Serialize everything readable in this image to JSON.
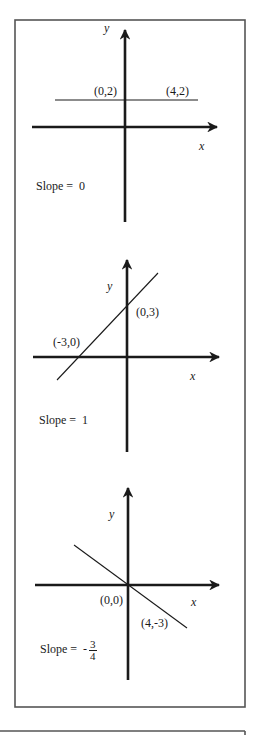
{
  "colors": {
    "ink": "#1a1a1a",
    "frame": "#555555",
    "background": "#ffffff"
  },
  "frame": {
    "x": 15,
    "y": 20,
    "w": 230,
    "h": 687
  },
  "next_frame": {
    "x": 0,
    "y": 731,
    "w": 245
  },
  "panels": [
    {
      "id": "zero-slope",
      "y_axis": {
        "x": 125,
        "top": 30,
        "bottom": 222
      },
      "x_axis": {
        "y": 127,
        "left": 32,
        "right": 217
      },
      "line": {
        "x1": 55,
        "y1": 100,
        "x2": 198,
        "y2": 100
      },
      "labels": [
        {
          "name": "y-axis-label",
          "text": "y",
          "x": 104,
          "y": 22,
          "axis": true
        },
        {
          "name": "point-label-0-2",
          "text": "(0,2)",
          "x": 94,
          "y": 85
        },
        {
          "name": "point-label-4-2",
          "text": "(4,2)",
          "x": 166,
          "y": 85
        },
        {
          "name": "x-axis-label",
          "text": "x",
          "x": 199,
          "y": 140,
          "axis": true
        }
      ],
      "slope": {
        "prefix": "Slope =  ",
        "value": "0",
        "x": 36,
        "y": 180
      }
    },
    {
      "id": "positive-slope",
      "y_axis": {
        "x": 127,
        "top": 260,
        "bottom": 452
      },
      "x_axis": {
        "y": 357,
        "left": 33,
        "right": 219
      },
      "line": {
        "x1": 57,
        "y1": 380,
        "x2": 158,
        "y2": 273
      },
      "labels": [
        {
          "name": "y-axis-label",
          "text": "y",
          "x": 107,
          "y": 280,
          "axis": true
        },
        {
          "name": "point-label-0-3",
          "text": "(0,3)",
          "x": 136,
          "y": 306
        },
        {
          "name": "point-label-neg3-0",
          "text": "(-3,0)",
          "x": 53,
          "y": 336
        },
        {
          "name": "x-axis-label",
          "text": "x",
          "x": 190,
          "y": 370,
          "axis": true
        }
      ],
      "slope": {
        "prefix": "Slope =  ",
        "value": "1",
        "x": 39,
        "y": 414
      }
    },
    {
      "id": "negative-slope",
      "y_axis": {
        "x": 128,
        "top": 488,
        "bottom": 680
      },
      "x_axis": {
        "y": 585,
        "left": 35,
        "right": 219
      },
      "line": {
        "x1": 74,
        "y1": 545,
        "x2": 187,
        "y2": 628
      },
      "labels": [
        {
          "name": "y-axis-label",
          "text": "y",
          "x": 109,
          "y": 508,
          "axis": true
        },
        {
          "name": "point-label-0-0",
          "text": "(0,0)",
          "x": 100,
          "y": 594
        },
        {
          "name": "x-axis-label",
          "text": "x",
          "x": 191,
          "y": 596,
          "axis": true
        },
        {
          "name": "point-label-4-neg3",
          "text": "(4,-3)",
          "x": 141,
          "y": 617
        }
      ],
      "slope": {
        "prefix": "Slope =  -",
        "numerator": "3",
        "denominator": "4",
        "x": 40,
        "y": 639
      }
    }
  ],
  "chart_data": {
    "type": "line",
    "title": "",
    "xlabel": "x",
    "ylabel": "y",
    "series": [
      {
        "name": "Slope = 0",
        "points": [
          [
            0,
            2
          ],
          [
            4,
            2
          ]
        ],
        "slope": 0
      },
      {
        "name": "Slope = 1",
        "points": [
          [
            -3,
            0
          ],
          [
            0,
            3
          ]
        ],
        "slope": 1
      },
      {
        "name": "Slope = -3/4",
        "points": [
          [
            0,
            0
          ],
          [
            4,
            -3
          ]
        ],
        "slope": -0.75
      }
    ],
    "grid": false,
    "legend": "none"
  }
}
